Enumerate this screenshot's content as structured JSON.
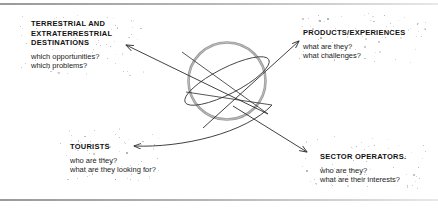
{
  "diagram": {
    "center_object": {
      "name": "planet-with-ring",
      "shape": "circle-with-elliptical-ring",
      "outline_color": "#8c8c8c",
      "ring_color": "#4a4a4a"
    },
    "frame": {
      "top_rule_color": "#9a9a9a",
      "bottom_rule_color": "#9a9a9a"
    },
    "arrow_color": "#2b2b2b",
    "nodes": [
      {
        "id": "destinations",
        "title": "TERRESTRIAL AND\nEXTRATERRESTRIAL\nDESTINATIONS",
        "lines": [
          "which opportunities?",
          "which problems?"
        ]
      },
      {
        "id": "products",
        "title": "PRODUCTS/EXPERIENCES",
        "lines": [
          "what are they?",
          "what challenges?"
        ]
      },
      {
        "id": "tourists",
        "title": "TOURISTS",
        "lines": [
          "who are they?",
          "what are they looking for?"
        ]
      },
      {
        "id": "operators",
        "title": "SECTOR OPERATORS.",
        "lines": [
          "who are they?",
          "what are their interests?"
        ]
      }
    ],
    "arrows": [
      {
        "id": "to-destinations",
        "from": "planet-lower-right",
        "to": "destinations"
      },
      {
        "id": "to-products",
        "from": "planet-lower-left",
        "to": "products"
      },
      {
        "id": "to-tourists",
        "from": "planet-right",
        "to": "tourists"
      },
      {
        "id": "to-operators",
        "from": "planet-upper-left",
        "to": "operators"
      }
    ]
  }
}
